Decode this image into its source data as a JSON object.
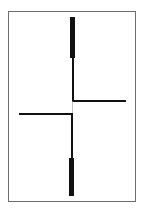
{
  "figure": {
    "type": "line-diagram",
    "frame": {
      "x": 8,
      "y": 11,
      "width": 127,
      "height": 190,
      "stroke": "#6e6e6e"
    },
    "colors": {
      "stroke": "#111111",
      "faint": "#9a9a9a",
      "background": "#ffffff"
    },
    "elements": [
      {
        "name": "top-thick-bar",
        "kind": "rect",
        "x": 70,
        "y": 17,
        "width": 5,
        "height": 41
      },
      {
        "name": "upper-thin-vertical",
        "kind": "line",
        "x1": 73,
        "y1": 58,
        "x2": 73,
        "y2": 101,
        "width": 2
      },
      {
        "name": "right-horizontal-arm",
        "kind": "line",
        "x1": 72,
        "y1": 101,
        "x2": 126,
        "y2": 101,
        "width": 2
      },
      {
        "name": "center-faint-connector",
        "kind": "line",
        "x1": 72.5,
        "y1": 101,
        "x2": 72.5,
        "y2": 114,
        "width": 0.6
      },
      {
        "name": "left-horizontal-arm",
        "kind": "line",
        "x1": 19,
        "y1": 114,
        "x2": 73,
        "y2": 114,
        "width": 2
      },
      {
        "name": "lower-thin-vertical",
        "kind": "line",
        "x1": 72,
        "y1": 114,
        "x2": 72,
        "y2": 158,
        "width": 2
      },
      {
        "name": "bottom-thick-bar",
        "kind": "rect",
        "x": 69,
        "y": 158,
        "width": 5,
        "height": 38
      }
    ]
  }
}
